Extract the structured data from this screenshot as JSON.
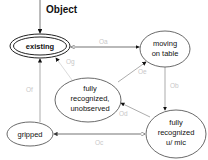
{
  "diagram": {
    "title": "Object",
    "states": [
      {
        "id": "existing",
        "label": [
          "existing"
        ],
        "initial": true,
        "double": true
      },
      {
        "id": "moving",
        "label": [
          "moving",
          "on table"
        ]
      },
      {
        "id": "unobserved",
        "label": [
          "fully",
          "recognized,",
          "unobserved"
        ]
      },
      {
        "id": "gripped",
        "label": [
          "gripped"
        ]
      },
      {
        "id": "mic",
        "label": [
          "fully",
          "recognized",
          "u/ mic"
        ]
      }
    ],
    "edges": [
      {
        "label": "Oa",
        "from": "existing",
        "to": "moving"
      },
      {
        "label": "Ob",
        "from": "moving",
        "to": "mic"
      },
      {
        "label": "Oc",
        "from": "mic",
        "to": "gripped"
      },
      {
        "label": "Od",
        "from": "mic",
        "to": "unobserved"
      },
      {
        "label": "Oe",
        "from": "unobserved",
        "to": "moving"
      },
      {
        "label": "Of",
        "from": "gripped",
        "to": "existing"
      },
      {
        "label": "Og",
        "from": "unobserved",
        "to": "existing"
      }
    ],
    "colors": {
      "line": "#555555",
      "edge_label": "#c8c8c8",
      "text": "#111111"
    }
  }
}
